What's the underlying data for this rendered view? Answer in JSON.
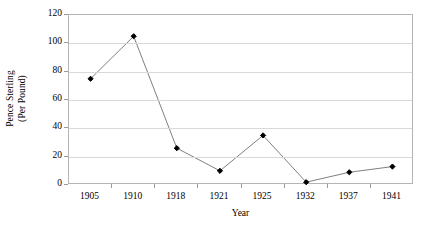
{
  "chart_data": {
    "type": "line",
    "title": "",
    "xlabel": "Year",
    "ylabel": "Pence Sterling (Per Pound)",
    "ylabel_line1": "Pence Sterling",
    "ylabel_line2": "(Per Pound)",
    "categories": [
      "1905",
      "1910",
      "1918",
      "1921",
      "1925",
      "1932",
      "1937",
      "1941"
    ],
    "values": [
      75,
      105,
      26,
      10,
      35,
      2,
      9,
      13
    ],
    "series": [
      {
        "name": "Pence Sterling (Per Pound)",
        "values": [
          75,
          105,
          26,
          10,
          35,
          2,
          9,
          13
        ]
      }
    ],
    "ylim": [
      0,
      120
    ],
    "y_ticks": [
      0,
      20,
      40,
      60,
      80,
      100,
      120
    ],
    "y_tick_labels": [
      "0",
      "20",
      "40",
      "60",
      "80",
      "100",
      "120"
    ],
    "grid": "horizontal",
    "legend": "none",
    "marker": "diamond",
    "marker_color": "#000000",
    "line_color": "#7f7f7f",
    "gridline_color": "#d9d9d9",
    "axis_color": "#b4b4b4",
    "plot_background": "#ffffff"
  }
}
